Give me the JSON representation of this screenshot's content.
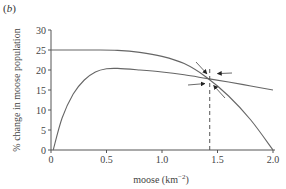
{
  "panel_label": "b",
  "chart_data": {
    "type": "line",
    "title": "",
    "panel": "(b)",
    "xlabel": "moose (km⁻²)",
    "ylabel": "% change in moose population",
    "xlim": [
      0,
      2.0
    ],
    "ylim": [
      0,
      30
    ],
    "x_ticks": [
      "0",
      "0.5",
      "1.0",
      "1.5",
      "2.0"
    ],
    "y_ticks": [
      "0",
      "5",
      "10",
      "15",
      "20",
      "25",
      "30"
    ],
    "grid": false,
    "legend": null,
    "series": [
      {
        "name": "upper curve (declining from plateau)",
        "x": [
          0,
          0.2,
          0.4,
          0.6,
          0.8,
          1.0,
          1.2,
          1.4,
          1.6,
          1.8,
          2.0
        ],
        "y": [
          25,
          25,
          25,
          24.9,
          24.4,
          23.4,
          21.6,
          18.2,
          13.5,
          7.5,
          0
        ]
      },
      {
        "name": "lower curve (rising then gently declining)",
        "x": [
          0.02,
          0.1,
          0.2,
          0.3,
          0.4,
          0.5,
          0.6,
          0.8,
          1.0,
          1.2,
          1.4,
          1.6,
          1.8,
          2.0
        ],
        "y": [
          0,
          8,
          14,
          17.5,
          19.5,
          20.3,
          20.4,
          20.0,
          19.5,
          18.8,
          17.9,
          17.0,
          16.0,
          15.0
        ]
      }
    ],
    "annotations": [
      {
        "type": "vline",
        "x": 1.43,
        "style": "dashed",
        "from_y": 0,
        "to_y": 17.6
      },
      {
        "type": "intersection",
        "x": 1.43,
        "y": 17.6
      },
      {
        "type": "arrows",
        "count": 4,
        "pointing_to": "intersection"
      }
    ]
  },
  "axes": {
    "x_title": "moose (km",
    "x_title_sup": "−2",
    "x_title_end": ")",
    "y_title": "% change in moose population"
  }
}
